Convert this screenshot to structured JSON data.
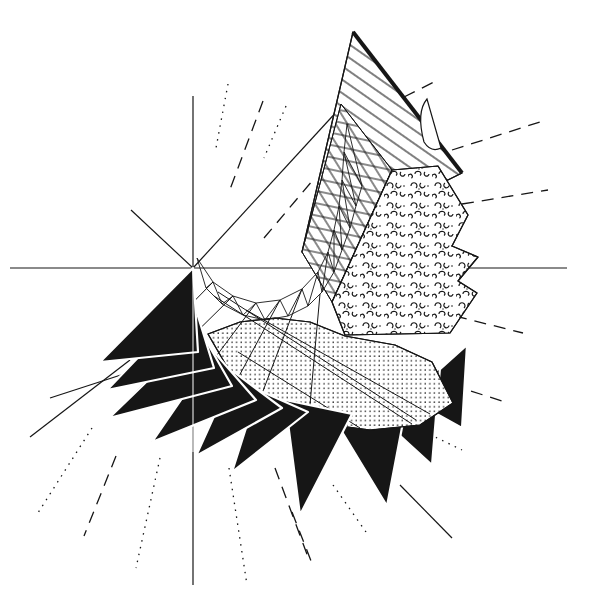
{
  "figure": {
    "kind": "geometric-line-drawing",
    "background_color": "#ffffff",
    "ink_color": "#161616",
    "canvas": {
      "width": 589,
      "height": 606
    }
  },
  "fills": {
    "ink": "#161616",
    "white": "#ffffff",
    "hatchA": "@hatchA",
    "hatchB": "@hatchB",
    "hatchC": "@hatchC",
    "dots": "@dots",
    "pebble": "@pebble"
  },
  "axes": [
    {
      "name": "horizontal-axis",
      "x1": 10,
      "y1": 268,
      "x2": 567,
      "y2": 268
    },
    {
      "name": "vertical-axis",
      "x1": 193,
      "y1": 96,
      "x2": 193,
      "y2": 585
    }
  ],
  "solid_rays": [
    {
      "name": "ray-upper-right",
      "x1": 193,
      "y1": 268,
      "x2": 340,
      "y2": 108
    },
    {
      "name": "ray-upper-left",
      "x1": 193,
      "y1": 268,
      "x2": 131,
      "y2": 210
    },
    {
      "name": "ray-lower-left-a",
      "x1": 30,
      "y1": 437,
      "x2": 130,
      "y2": 360
    },
    {
      "name": "ray-lower-left-b",
      "x1": 50,
      "y1": 398,
      "x2": 167,
      "y2": 360
    },
    {
      "name": "ray-lower-right",
      "x1": 400,
      "y1": 485,
      "x2": 452,
      "y2": 538
    }
  ],
  "dashed_rays": [
    {
      "x1": 228,
      "y1": 84,
      "x2": 216,
      "y2": 148,
      "style": "dotted"
    },
    {
      "x1": 263,
      "y1": 101,
      "x2": 229,
      "y2": 192,
      "style": "long"
    },
    {
      "x1": 286,
      "y1": 106,
      "x2": 264,
      "y2": 158,
      "style": "dotted"
    },
    {
      "x1": 264,
      "y1": 238,
      "x2": 313,
      "y2": 180,
      "style": "long"
    },
    {
      "x1": 404,
      "y1": 97,
      "x2": 436,
      "y2": 81,
      "style": "long"
    },
    {
      "x1": 452,
      "y1": 150,
      "x2": 540,
      "y2": 122,
      "style": "long"
    },
    {
      "x1": 462,
      "y1": 204,
      "x2": 548,
      "y2": 190,
      "style": "long"
    },
    {
      "x1": 455,
      "y1": 316,
      "x2": 523,
      "y2": 333,
      "style": "long"
    },
    {
      "x1": 452,
      "y1": 385,
      "x2": 502,
      "y2": 401,
      "style": "long"
    },
    {
      "x1": 398,
      "y1": 419,
      "x2": 462,
      "y2": 450,
      "style": "dotted"
    },
    {
      "x1": 292,
      "y1": 512,
      "x2": 313,
      "y2": 566,
      "style": "long"
    },
    {
      "x1": 92,
      "y1": 428,
      "x2": 36,
      "y2": 516,
      "style": "dotted"
    },
    {
      "x1": 116,
      "y1": 456,
      "x2": 84,
      "y2": 536,
      "style": "long"
    },
    {
      "x1": 160,
      "y1": 458,
      "x2": 136,
      "y2": 568,
      "style": "dotted"
    },
    {
      "x1": 229,
      "y1": 468,
      "x2": 247,
      "y2": 585,
      "style": "dotted"
    },
    {
      "x1": 275,
      "y1": 468,
      "x2": 308,
      "y2": 557,
      "style": "long"
    },
    {
      "x1": 333,
      "y1": 485,
      "x2": 366,
      "y2": 532,
      "style": "dotted"
    }
  ],
  "shapes": [
    {
      "name": "hatched-sail-bg",
      "type": "polygon",
      "points": [
        [
          353,
          32
        ],
        [
          302,
          252
        ],
        [
          462,
          173
        ]
      ],
      "fill": "white",
      "stroke": 1.2
    },
    {
      "name": "hatched-sail",
      "type": "polygon",
      "points": [
        [
          353,
          32
        ],
        [
          302,
          252
        ],
        [
          462,
          173
        ]
      ],
      "fill": "hatchA",
      "stroke": 1.2
    },
    {
      "name": "crosshatch-flag-bg",
      "type": "polygon",
      "points": [
        [
          341,
          104
        ],
        [
          392,
          170
        ],
        [
          332,
          302
        ],
        [
          302,
          252
        ]
      ],
      "fill": "white",
      "stroke": 1
    },
    {
      "name": "crosshatch-flag-1",
      "type": "polygon",
      "points": [
        [
          341,
          104
        ],
        [
          392,
          170
        ],
        [
          332,
          302
        ],
        [
          302,
          252
        ]
      ],
      "fill": "hatchB",
      "stroke": 0
    },
    {
      "name": "crosshatch-flag-2",
      "type": "polygon",
      "points": [
        [
          341,
          104
        ],
        [
          392,
          170
        ],
        [
          332,
          302
        ],
        [
          302,
          252
        ]
      ],
      "fill": "hatchC",
      "stroke": 1
    },
    {
      "name": "pebble-flag-bg",
      "type": "polygon",
      "points": [
        [
          392,
          170
        ],
        [
          438,
          166
        ],
        [
          468,
          215
        ],
        [
          452,
          246
        ],
        [
          478,
          257
        ],
        [
          458,
          281
        ],
        [
          477,
          293
        ],
        [
          450,
          333
        ],
        [
          345,
          335
        ],
        [
          332,
          302
        ]
      ],
      "fill": "white",
      "stroke": 1.2
    },
    {
      "name": "pebble-flag",
      "type": "polygon",
      "points": [
        [
          392,
          170
        ],
        [
          438,
          166
        ],
        [
          468,
          215
        ],
        [
          452,
          246
        ],
        [
          478,
          257
        ],
        [
          458,
          281
        ],
        [
          477,
          293
        ],
        [
          450,
          333
        ],
        [
          345,
          335
        ],
        [
          332,
          302
        ]
      ],
      "fill": "pebble",
      "stroke": 1.2
    },
    {
      "name": "sail-thick-edge",
      "type": "line",
      "x1": 353,
      "y1": 32,
      "x2": 462,
      "y2": 173,
      "width": 4
    },
    {
      "name": "sail-horn",
      "type": "path",
      "d": "M424,142 Q416,112 427,99 Q433,120 441,148 Q431,153 424,142 Z",
      "fill": "white",
      "stroke": 1.2
    },
    {
      "name": "black-blade-10",
      "type": "polygon",
      "points": [
        [
          408,
          398
        ],
        [
          467,
          345
        ],
        [
          462,
          428
        ]
      ],
      "fill": "ink",
      "strokeFill": "white",
      "stroke": 2.2
    },
    {
      "name": "black-blade-9",
      "type": "polygon",
      "points": [
        [
          372,
          410
        ],
        [
          440,
          368
        ],
        [
          432,
          465
        ]
      ],
      "fill": "ink",
      "strokeFill": "white",
      "stroke": 2.2
    },
    {
      "name": "black-blade-8",
      "type": "polygon",
      "points": [
        [
          330,
          412
        ],
        [
          408,
          396
        ],
        [
          387,
          506
        ]
      ],
      "fill": "ink",
      "strokeFill": "white",
      "stroke": 2.2
    },
    {
      "name": "stipple-fan-bg",
      "type": "polygon",
      "points": [
        [
          208,
          334
        ],
        [
          240,
          322
        ],
        [
          275,
          318
        ],
        [
          310,
          322
        ],
        [
          345,
          336
        ],
        [
          395,
          345
        ],
        [
          432,
          362
        ],
        [
          453,
          403
        ],
        [
          420,
          425
        ],
        [
          370,
          430
        ],
        [
          318,
          423
        ],
        [
          268,
          405
        ],
        [
          230,
          372
        ]
      ],
      "fill": "white",
      "stroke": 1.2
    },
    {
      "name": "stipple-fan",
      "type": "polygon",
      "points": [
        [
          208,
          334
        ],
        [
          240,
          322
        ],
        [
          275,
          318
        ],
        [
          310,
          322
        ],
        [
          345,
          336
        ],
        [
          395,
          345
        ],
        [
          432,
          362
        ],
        [
          453,
          403
        ],
        [
          420,
          425
        ],
        [
          370,
          430
        ],
        [
          318,
          423
        ],
        [
          268,
          405
        ],
        [
          230,
          372
        ]
      ],
      "fill": "dots",
      "stroke": 1.2
    },
    {
      "name": "stipple-seam-1",
      "type": "line",
      "x1": 214,
      "y1": 296,
      "x2": 412,
      "y2": 424,
      "width": 1
    },
    {
      "name": "stipple-seam-2",
      "type": "line",
      "x1": 218,
      "y1": 292,
      "x2": 416,
      "y2": 420,
      "width": 1
    },
    {
      "name": "stipple-seam-3",
      "type": "line",
      "x1": 246,
      "y1": 310,
      "x2": 430,
      "y2": 414,
      "width": 1
    },
    {
      "name": "stipple-seam-4",
      "type": "line",
      "x1": 238,
      "y1": 352,
      "x2": 360,
      "y2": 428,
      "width": 1
    },
    {
      "name": "spoke-1",
      "type": "line",
      "x1": 213,
      "y1": 282,
      "x2": 107,
      "y2": 390,
      "width": 1
    },
    {
      "name": "spoke-2",
      "type": "line",
      "x1": 233,
      "y1": 296,
      "x2": 109,
      "y2": 418,
      "width": 1
    },
    {
      "name": "spoke-3",
      "type": "line",
      "x1": 256,
      "y1": 303,
      "x2": 152,
      "y2": 442,
      "width": 1
    },
    {
      "name": "spoke-4",
      "type": "line",
      "x1": 280,
      "y1": 300,
      "x2": 196,
      "y2": 456,
      "width": 1
    },
    {
      "name": "spoke-5",
      "type": "line",
      "x1": 302,
      "y1": 289,
      "x2": 232,
      "y2": 472,
      "width": 1
    },
    {
      "name": "spoke-6",
      "type": "line",
      "x1": 320,
      "y1": 294,
      "x2": 300,
      "y2": 515,
      "width": 1
    },
    {
      "name": "black-blade-7",
      "type": "polygon",
      "points": [
        [
          285,
          400
        ],
        [
          352,
          414
        ],
        [
          300,
          515
        ]
      ],
      "fill": "ink",
      "strokeFill": "white",
      "stroke": 2.2
    },
    {
      "name": "black-blade-6",
      "type": "polygon",
      "points": [
        [
          258,
          390
        ],
        [
          308,
          412
        ],
        [
          232,
          472
        ]
      ],
      "fill": "ink",
      "strokeFill": "white",
      "stroke": 2.2
    },
    {
      "name": "black-blade-5",
      "type": "polygon",
      "points": [
        [
          234,
          372
        ],
        [
          282,
          408
        ],
        [
          196,
          456
        ]
      ],
      "fill": "ink",
      "strokeFill": "white",
      "stroke": 2.2
    },
    {
      "name": "black-blade-4",
      "type": "polygon",
      "points": [
        [
          214,
          352
        ],
        [
          256,
          400
        ],
        [
          152,
          442
        ]
      ],
      "fill": "ink",
      "strokeFill": "white",
      "stroke": 2.2
    },
    {
      "name": "black-blade-3",
      "type": "polygon",
      "points": [
        [
          200,
          330
        ],
        [
          232,
          386
        ],
        [
          109,
          418
        ]
      ],
      "fill": "ink",
      "strokeFill": "white",
      "stroke": 2.2
    },
    {
      "name": "black-blade-2",
      "type": "polygon",
      "points": [
        [
          193,
          300
        ],
        [
          214,
          368
        ],
        [
          107,
          390
        ]
      ],
      "fill": "ink",
      "strokeFill": "white",
      "stroke": 2.2
    },
    {
      "name": "black-blade-1",
      "type": "polygon",
      "points": [
        [
          193,
          268
        ],
        [
          198,
          352
        ],
        [
          100,
          362
        ]
      ],
      "fill": "ink",
      "strokeFill": "white",
      "stroke": 2.2
    },
    {
      "name": "axis-seam-over-blade",
      "type": "line",
      "x1": 193,
      "y1": 272,
      "x2": 193,
      "y2": 452,
      "width": 1,
      "color": "white"
    }
  ],
  "mesh": {
    "upper_chain": [
      [
        197,
        258
      ],
      [
        213,
        282
      ],
      [
        233,
        296
      ],
      [
        256,
        303
      ],
      [
        280,
        300
      ],
      [
        302,
        289
      ],
      [
        318,
        272
      ],
      [
        328,
        252
      ],
      [
        334,
        230
      ],
      [
        339,
        206
      ],
      [
        342,
        180
      ],
      [
        344,
        152
      ],
      [
        347,
        124
      ]
    ],
    "lower_chain": [
      [
        206,
        288
      ],
      [
        222,
        304
      ],
      [
        243,
        315
      ],
      [
        265,
        320
      ],
      [
        288,
        316
      ],
      [
        308,
        306
      ],
      [
        322,
        292
      ],
      [
        334,
        272
      ],
      [
        342,
        250
      ],
      [
        350,
        228
      ],
      [
        356,
        206
      ],
      [
        362,
        186
      ]
    ],
    "stroke_width": 0.9
  },
  "dash_styles": {
    "dotted": "1.5 5.5",
    "long": "12 8"
  }
}
